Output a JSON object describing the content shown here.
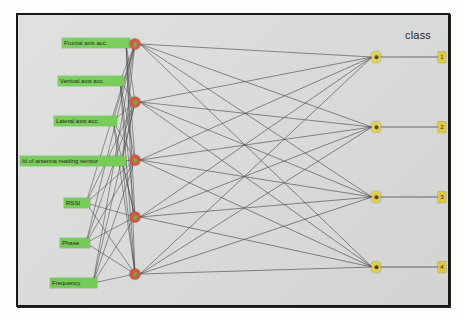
{
  "figure": {
    "type": "neural-network-diagram",
    "background_color": "#dcdedb",
    "border_color": "#18181a",
    "class_title": "class",
    "input_color": "#6fcc4e",
    "hidden_color": "#cf4f37",
    "output_color": "#e8d44a",
    "edge_color": "#3a3a3a"
  },
  "input_layer": {
    "name": "input-features",
    "nodes": [
      {
        "label": "Frontal axis acc.",
        "x": 44,
        "y": 23,
        "w": 64
      },
      {
        "label": "Vertical axis acc.",
        "x": 40,
        "y": 61,
        "w": 62
      },
      {
        "label": "Lateral axis acc.",
        "x": 36,
        "y": 101,
        "w": 59
      },
      {
        "label": "Id of antenna reading sensor",
        "x": 2,
        "y": 141,
        "w": 102
      },
      {
        "label": "RSSI",
        "x": 46,
        "y": 183,
        "w": 22
      },
      {
        "label": "Phase",
        "x": 42,
        "y": 223,
        "w": 26
      },
      {
        "label": "Frequency",
        "x": 32,
        "y": 263,
        "w": 43
      }
    ]
  },
  "hidden_layer": {
    "name": "hidden-neurons",
    "count": 5,
    "nodes": [
      {
        "id": "h1",
        "x": 117,
        "y": 29
      },
      {
        "id": "h2",
        "x": 117,
        "y": 87
      },
      {
        "id": "h3",
        "x": 117,
        "y": 145
      },
      {
        "id": "h4",
        "x": 117,
        "y": 202
      },
      {
        "id": "h5",
        "x": 117,
        "y": 259
      }
    ]
  },
  "output_layer": {
    "name": "output-neurons",
    "count": 4,
    "nodes": [
      {
        "id": "o1",
        "x": 358,
        "y": 42,
        "class_value": "1"
      },
      {
        "id": "o2",
        "x": 358,
        "y": 112,
        "class_value": "2"
      },
      {
        "id": "o3",
        "x": 358,
        "y": 182,
        "class_value": "3"
      },
      {
        "id": "o4",
        "x": 358,
        "y": 252,
        "class_value": "4"
      }
    ]
  },
  "class_labels": {
    "name": "class-values",
    "x": 424,
    "items": [
      {
        "value": "1",
        "y": 42
      },
      {
        "value": "2",
        "y": 112
      },
      {
        "value": "3",
        "y": 182
      },
      {
        "value": "4",
        "y": 252
      }
    ]
  },
  "class_title_pos": {
    "x": 387,
    "y": 14
  }
}
